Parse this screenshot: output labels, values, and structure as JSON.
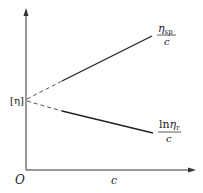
{
  "diagram": {
    "title": "",
    "axes": {
      "origin_label": "O",
      "x_label": "c",
      "y_label": ""
    },
    "intercept_label": "[η]",
    "lines": [
      {
        "name": "eta-sp-over-c",
        "numerator": "η",
        "numerator_subscript": "sp",
        "denominator": "c",
        "trend": "increasing"
      },
      {
        "name": "ln-eta-r-over-c",
        "numerator_prefix": "ln",
        "numerator": "η",
        "numerator_subscript": "r",
        "denominator": "c",
        "trend": "decreasing"
      }
    ],
    "colors": {
      "line": "#222222",
      "dashed": "#555555",
      "axis": "#333333"
    }
  }
}
